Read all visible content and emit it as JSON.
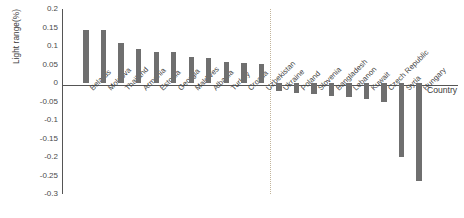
{
  "chart_data": {
    "type": "bar",
    "title": "",
    "xlabel": "Country",
    "ylabel": "Light range(%)",
    "ylim": [
      -0.3,
      0.2
    ],
    "ytick_labels": [
      "0.2",
      "0.15",
      "0.1",
      "0.05",
      "0",
      "-0.05",
      "-0.1",
      "-0.15",
      "-0.2",
      "-0.25",
      "-0.3"
    ],
    "ytick_values": [
      0.2,
      0.15,
      0.1,
      0.05,
      0,
      -0.05,
      -0.1,
      -0.15,
      -0.2,
      -0.25,
      -0.3
    ],
    "grid": false,
    "legend": "none",
    "bar_color": "#6f6f6f",
    "axis_color": "#555555",
    "divider_color": "#c2b49a",
    "divider_after_category": "Uzbekistan",
    "categories": [
      "Belarus",
      "Moldova",
      "Thailand",
      "Armenia",
      "Estonia",
      "Georgia",
      "Maldives",
      "Albania",
      "Turkey",
      "Croatia",
      "Uzbekistan",
      "Ukraine",
      "Poland",
      "Slovenia",
      "Bangladesh",
      "Lebanon",
      "Kuwait",
      "Czech Republic",
      "Syria",
      "Hungary"
    ],
    "values": [
      0.143,
      0.143,
      0.107,
      0.091,
      0.085,
      0.083,
      0.07,
      0.068,
      0.057,
      0.055,
      0.052,
      -0.022,
      -0.026,
      -0.03,
      -0.034,
      -0.038,
      -0.044,
      -0.05,
      -0.2,
      -0.265
    ]
  }
}
